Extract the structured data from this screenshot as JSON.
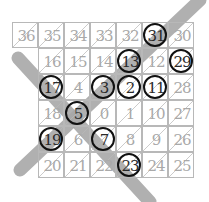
{
  "diagram": {
    "grid": {
      "cell_size": 26,
      "origin_x": 12,
      "origin_y": 22,
      "rows": [
        {
          "start_col": 0,
          "cells": [
            36,
            35,
            34,
            33,
            32,
            31,
            30
          ]
        },
        {
          "start_col": 1,
          "cells": [
            16,
            15,
            14,
            13,
            12,
            29
          ]
        },
        {
          "start_col": 0,
          "cells": [
            17,
            4,
            3,
            2,
            11,
            28
          ],
          "offset_col": 1
        },
        {
          "start_col": 1,
          "cells": [
            18,
            5,
            0,
            1,
            10,
            27
          ]
        },
        {
          "start_col": 1,
          "cells": [
            19,
            6,
            7,
            8,
            9,
            26
          ]
        },
        {
          "start_col": 1,
          "cells": [
            20,
            21,
            22,
            23,
            24,
            25
          ]
        }
      ]
    },
    "circled_primes": [
      31,
      13,
      29,
      17,
      3,
      2,
      11,
      5,
      19,
      7,
      23
    ],
    "colors": {
      "grid_line": "#b8b8b8",
      "faded_number": "#a9a9a9",
      "prime_number": "#2a2a2a",
      "circle": "#111111",
      "diagonal_band": "#a8a8a8"
    }
  }
}
